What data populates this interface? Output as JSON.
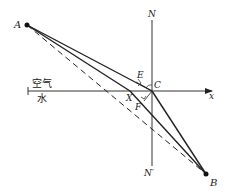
{
  "figure": {
    "labels": {
      "A": "A",
      "B": "B",
      "C": "C",
      "E": "E",
      "F": "F",
      "X": "X",
      "N": "N",
      "N_prime": "N′",
      "x_axis": "x",
      "air": "空气",
      "water": "水"
    },
    "points": {
      "A": [
        27,
        25
      ],
      "B": [
        206,
        174
      ],
      "C": [
        152,
        91
      ],
      "E": [
        133,
        83
      ],
      "F": [
        144,
        104
      ],
      "X": [
        130,
        96
      ]
    },
    "lines": {
      "interface": {
        "from": [
          28,
          91
        ],
        "to": [
          213,
          91
        ],
        "arrow": true
      },
      "normal": {
        "from": [
          152,
          20
        ],
        "to": [
          152,
          166
        ]
      },
      "A_to_C_ray": {
        "style": "solid"
      },
      "C_to_B_ray": {
        "style": "solid"
      },
      "A_to_X_to_B": {
        "style": "solid"
      },
      "A_to_B_straight": {
        "style": "dashed"
      }
    },
    "colors": {
      "stroke": "#222222",
      "background": "#ffffff"
    }
  }
}
